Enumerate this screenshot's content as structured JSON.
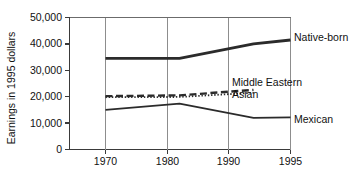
{
  "chart_data": {
    "type": "line",
    "title": "",
    "xlabel": "",
    "ylabel": "Earnings in 1995 dollars",
    "x": [
      1970,
      1980,
      1990,
      1995
    ],
    "xticklabels": [
      "1970",
      "1980",
      "1990",
      "1995"
    ],
    "yticks": [
      0,
      10000,
      20000,
      30000,
      40000,
      50000
    ],
    "yticklabels": [
      "0",
      "10,000",
      "20,000",
      "30,000",
      "40,000",
      "50,000"
    ],
    "ylim": [
      0,
      50000
    ],
    "xlim": [
      1970,
      1995
    ],
    "grid": "vertical",
    "legend_position": "inline-right",
    "series": [
      {
        "name": "Native-born",
        "style": "solid-thick",
        "x": [
          1970,
          1980,
          1990,
          1995
        ],
        "values": [
          34500,
          34500,
          40000,
          41500
        ]
      },
      {
        "name": "Middle Eastern",
        "style": "dashed",
        "x": [
          1970,
          1980,
          1990
        ],
        "values": [
          20200,
          20500,
          22600
        ]
      },
      {
        "name": "Asian",
        "style": "dotted",
        "x": [
          1970,
          1980,
          1990
        ],
        "values": [
          19800,
          19900,
          21500
        ]
      },
      {
        "name": "Mexican",
        "style": "solid-thin",
        "x": [
          1970,
          1980,
          1990,
          1995
        ],
        "values": [
          15000,
          17400,
          12000,
          12200
        ]
      }
    ]
  },
  "axis": {
    "y_title": "Earnings in 1995 dollars",
    "y_tick_0": "0",
    "y_tick_1": "10,000",
    "y_tick_2": "20,000",
    "y_tick_3": "30,000",
    "y_tick_4": "40,000",
    "y_tick_5": "50,000",
    "x_tick_0": "1970",
    "x_tick_1": "1980",
    "x_tick_2": "1990",
    "x_tick_3": "1995"
  },
  "labels": {
    "native_born": "Native-born",
    "middle_eastern": "Middle Eastern",
    "asian": "Asian",
    "mexican": "Mexican"
  }
}
